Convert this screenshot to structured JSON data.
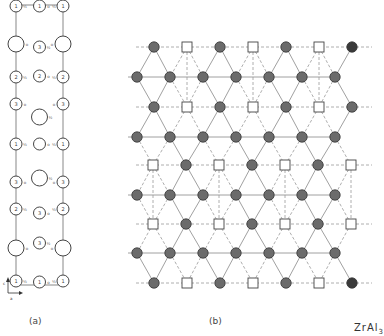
{
  "figure": {
    "compound": "ZrAl",
    "compound_subscript": "3",
    "panels": [
      {
        "id": "a",
        "caption": "(a)",
        "description": "Unit-cell projection with atom heights"
      },
      {
        "id": "b",
        "caption": "(b)",
        "description": "Layer stacking: close-packed triangular net of Al (filled circles) with Zr/vacancy sites (open squares)"
      }
    ],
    "axes": {
      "vertical": "c",
      "horizontal": "a"
    },
    "colors": {
      "line": "#888888",
      "dashed": "#999999",
      "filled_atom": "#6b6b6b",
      "filled_atom_dark": "#3a3a3a",
      "open_site": "#ffffff",
      "stroke": "#444444"
    }
  },
  "panel_a": {
    "frame": {
      "x1": 16,
      "y1": 5,
      "x2": 63,
      "y2": 285
    },
    "left_column": [
      {
        "y": 6,
        "r": 6,
        "label": "1",
        "height": "1/2"
      },
      {
        "y": 44,
        "r": 8,
        "label": "",
        "height": "0"
      },
      {
        "y": 77,
        "r": 6,
        "label": "2",
        "height": "1/2"
      },
      {
        "y": 104,
        "r": 6,
        "label": "3",
        "height": "0"
      },
      {
        "y": 144,
        "r": 6,
        "label": "1",
        "height": "1/2"
      },
      {
        "y": 182,
        "r": 6,
        "label": "3",
        "height": "0"
      },
      {
        "y": 209,
        "r": 6,
        "label": "2",
        "height": "1/2"
      },
      {
        "y": 248,
        "r": 8,
        "label": "",
        "height": "0"
      },
      {
        "y": 281,
        "r": 6,
        "label": "1",
        "height": "1/2"
      }
    ],
    "center_column": [
      {
        "y": 6,
        "r": 6,
        "label": "1",
        "height": "0"
      },
      {
        "y": 47,
        "r": 6,
        "label": "3",
        "height": "1/2"
      },
      {
        "y": 76,
        "r": 6,
        "label": "2",
        "height": "0"
      },
      {
        "y": 117,
        "r": 8,
        "label": "",
        "height": "1/2"
      },
      {
        "y": 144,
        "r": 6,
        "label": "",
        "height": "0"
      },
      {
        "y": 178,
        "r": 8,
        "label": "",
        "height": "1/2"
      },
      {
        "y": 213,
        "r": 6,
        "label": "3",
        "height": "0"
      },
      {
        "y": 243,
        "r": 6,
        "label": "3",
        "height": "1/2"
      },
      {
        "y": 282,
        "r": 6,
        "label": "1",
        "height": "0"
      }
    ],
    "right_column": [
      {
        "y": 6,
        "r": 6,
        "label": "1",
        "height": "1/2"
      },
      {
        "y": 44,
        "r": 8,
        "label": "",
        "height": "0"
      },
      {
        "y": 77,
        "r": 6,
        "label": "2",
        "height": "1/2"
      },
      {
        "y": 104,
        "r": 6,
        "label": "3",
        "height": "0"
      },
      {
        "y": 144,
        "r": 6,
        "label": "1",
        "height": "1/2"
      },
      {
        "y": 182,
        "r": 6,
        "label": "3",
        "height": "0"
      },
      {
        "y": 209,
        "r": 6,
        "label": "2",
        "height": "1/2"
      },
      {
        "y": 248,
        "r": 8,
        "label": "",
        "height": "0"
      },
      {
        "y": 281,
        "r": 6,
        "label": "1",
        "height": "1/2"
      }
    ]
  },
  "panel_b": {
    "row_type_mixed": {
      "circle_x": [
        154,
        220,
        286,
        352
      ],
      "square_x": [
        187,
        253,
        319
      ]
    },
    "row_type_shifted": {
      "square_x": [
        153,
        219,
        285,
        351
      ],
      "circle_x": [
        186,
        252,
        318
      ]
    },
    "row_type_full": {
      "circle_x": [
        137,
        170,
        203,
        236,
        269,
        302,
        335
      ]
    },
    "rows": [
      {
        "y": 47,
        "type": "mixed"
      },
      {
        "y": 77,
        "type": "full"
      },
      {
        "y": 107,
        "type": "mixed"
      },
      {
        "y": 137,
        "type": "full"
      },
      {
        "y": 165,
        "type": "shifted"
      },
      {
        "y": 195,
        "type": "full"
      },
      {
        "y": 224,
        "type": "shifted"
      },
      {
        "y": 253,
        "type": "full"
      },
      {
        "y": 283,
        "type": "mixed"
      }
    ]
  }
}
